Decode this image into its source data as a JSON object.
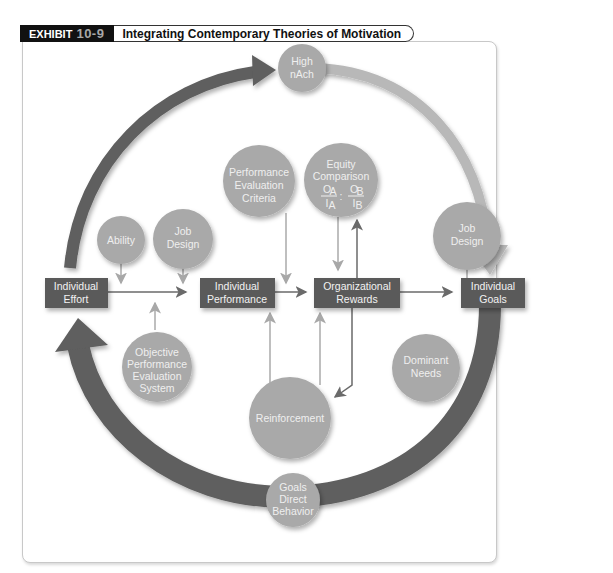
{
  "header": {
    "exhibit_label": "EXHIBIT",
    "exhibit_number": "10-9",
    "title": "Integrating Contemporary Theories of Motivation"
  },
  "boxes": {
    "individual_effort": [
      "Individual",
      "Effort"
    ],
    "individual_performance": [
      "Individual",
      "Performance"
    ],
    "organizational_rewards": [
      "Organizational",
      "Rewards"
    ],
    "individual_goals": [
      "Individual",
      "Goals"
    ]
  },
  "circles": {
    "high_nach": [
      "High",
      "nAch"
    ],
    "performance_evaluation_criteria": [
      "Performance",
      "Evaluation",
      "Criteria"
    ],
    "equity_comparison": [
      "Equity",
      "Comparison"
    ],
    "equity_formula": {
      "oa": "O",
      "oa_sub": "A",
      "ia": "I",
      "ia_sub": "A",
      "sep": ":",
      "ob": "O",
      "ob_sub": "B",
      "ib": "I",
      "ib_sub": "B"
    },
    "ability": [
      "Ability"
    ],
    "job_design_left": [
      "Job",
      "Design"
    ],
    "job_design_right": [
      "Job",
      "Design"
    ],
    "objective_performance_evaluation_system": [
      "Objective",
      "Performance",
      "Evaluation",
      "System"
    ],
    "reinforcement": [
      "Reinforcement"
    ],
    "dominant_needs": [
      "Dominant",
      "Needs"
    ],
    "goals_direct_behavior": [
      "Goals",
      "Direct",
      "Behavior"
    ]
  },
  "colors": {
    "box_fill": "#5a5a5a",
    "circle_fill": "#a9a9a9",
    "dark_arrow": "#5e5e5e",
    "light_arrow": "#b5b5b5",
    "connector": "#8a8a8a",
    "light_connector": "#b0b0b0"
  }
}
